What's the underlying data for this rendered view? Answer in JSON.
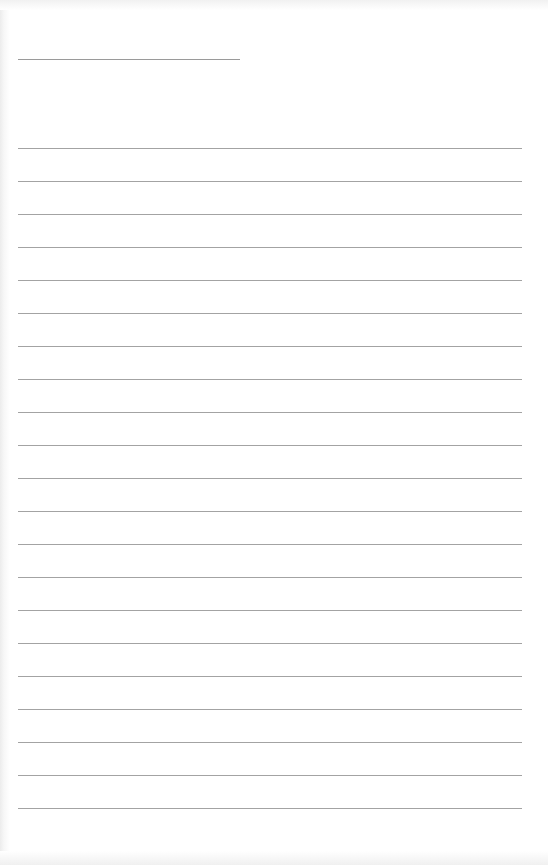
{
  "document": {
    "type": "blank lined page",
    "header_line": {
      "left": 18,
      "top": 59,
      "width": 222
    },
    "rules": {
      "count": 21,
      "left": 18,
      "top": 148,
      "width": 504,
      "spacing": 33
    },
    "colors": {
      "paper": "#ffffff",
      "rule": "#a3a3a3"
    }
  }
}
